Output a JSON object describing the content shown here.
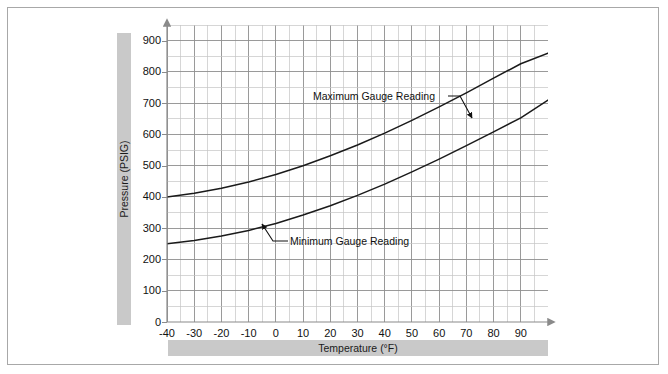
{
  "chart_data": {
    "type": "line",
    "title": "",
    "xlabel": "Temperature (°F)",
    "ylabel": "Pressure (PSIG)",
    "xlim": [
      -40,
      100
    ],
    "ylim": [
      0,
      950
    ],
    "x_ticks": [
      -40,
      -30,
      -20,
      -10,
      0,
      10,
      20,
      30,
      40,
      50,
      60,
      70,
      80,
      90
    ],
    "x_tick_labels": [
      "-40",
      "-30",
      "-20",
      "-10",
      "0",
      "10",
      "20",
      "30",
      "40",
      "50",
      "60",
      "70",
      "80",
      "90"
    ],
    "y_ticks": [
      0,
      100,
      200,
      300,
      400,
      500,
      600,
      700,
      800,
      900
    ],
    "y_tick_labels": [
      "0",
      "100",
      "200",
      "300",
      "400",
      "500",
      "600",
      "700",
      "800",
      "900"
    ],
    "x_minor_step": 5,
    "y_minor_step": 50,
    "grid": true,
    "legend": "none",
    "line_color": "#1a1a1a",
    "grid_major_color": "#8f8f8f",
    "grid_minor_color": "#c4c4c4",
    "series": [
      {
        "name": "Maximum Gauge Reading",
        "x": [
          -40,
          -30,
          -20,
          -10,
          0,
          10,
          20,
          30,
          40,
          50,
          60,
          70,
          80,
          90,
          100
        ],
        "values": [
          400,
          412,
          428,
          448,
          472,
          500,
          532,
          566,
          604,
          645,
          688,
          733,
          780,
          826,
          860
        ]
      },
      {
        "name": "Minimum Gauge Reading",
        "x": [
          -40,
          -30,
          -20,
          -10,
          0,
          10,
          20,
          30,
          40,
          50,
          60,
          70,
          80,
          90,
          100
        ],
        "values": [
          250,
          261,
          275,
          293,
          315,
          342,
          372,
          405,
          441,
          480,
          521,
          564,
          608,
          653,
          710
        ]
      }
    ],
    "annotations": [
      {
        "text": "Maximum Gauge Reading",
        "target_series": "Maximum Gauge Reading",
        "arrow": "down-right"
      },
      {
        "text": "Minimum Gauge Reading",
        "target_series": "Minimum Gauge Reading",
        "arrow": "up-left"
      }
    ]
  },
  "axis": {
    "y_label": "Pressure (PSIG)",
    "x_label": "Temperature (°F)"
  },
  "annotations": {
    "max_label": "Maximum Gauge Reading",
    "min_label": "Minimum Gauge Reading"
  },
  "ticks": {
    "y": [
      "900",
      "800",
      "700",
      "600",
      "500",
      "400",
      "300",
      "200",
      "100",
      "0"
    ],
    "x": [
      "-40",
      "-30",
      "-20",
      "-10",
      "0",
      "10",
      "20",
      "30",
      "40",
      "50",
      "60",
      "70",
      "80",
      "90"
    ]
  }
}
